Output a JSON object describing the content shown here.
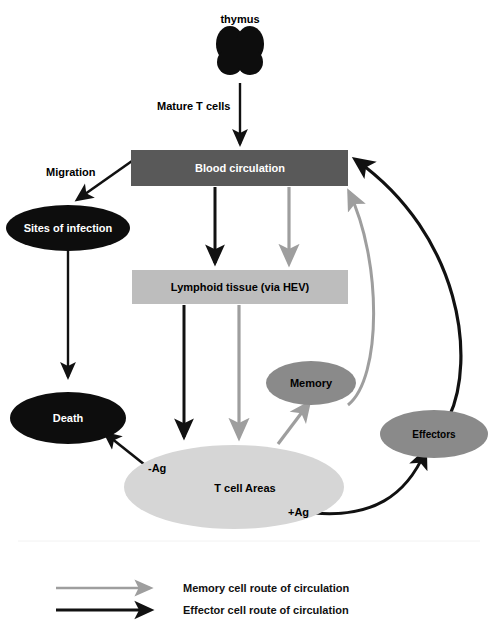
{
  "diagram": {
    "title_node": "thymus",
    "background": "#ffffff",
    "palette": {
      "black": "#0d0d0d",
      "dark_gray": "#595959",
      "mid_gray": "#8a8a8a",
      "light_gray": "#bdbdbd",
      "pale_gray": "#d6d6d6",
      "memory_arrow": "#9e9e9e",
      "effector_arrow": "#111111",
      "text_light": "#ffffff",
      "text_dark": "#000000"
    },
    "nodes": [
      {
        "id": "thymus",
        "label": "thymus",
        "shape": "bilobed",
        "fill": "#0d0d0d",
        "text_color": "#000000",
        "label_position": "above",
        "font_size": 11
      },
      {
        "id": "blood",
        "label": "Blood circulation",
        "shape": "rect",
        "fill": "#595959",
        "text_color": "#ffffff",
        "font_size": 11
      },
      {
        "id": "infection",
        "label": "Sites of infection",
        "shape": "ellipse",
        "fill": "#0d0d0d",
        "text_color": "#ffffff",
        "font_size": 11
      },
      {
        "id": "lymphoid",
        "label": "Lymphoid tissue (via HEV)",
        "shape": "rect",
        "fill": "#bdbdbd",
        "text_color": "#000000",
        "font_size": 11
      },
      {
        "id": "memory",
        "label": "Memory",
        "shape": "ellipse",
        "fill": "#8a8a8a",
        "text_color": "#000000",
        "font_size": 11
      },
      {
        "id": "death",
        "label": "Death",
        "shape": "ellipse",
        "fill": "#0d0d0d",
        "text_color": "#ffffff",
        "font_size": 11
      },
      {
        "id": "effectors",
        "label": "Effectors",
        "shape": "ellipse",
        "fill": "#8a8a8a",
        "text_color": "#000000",
        "font_size": 10
      },
      {
        "id": "tcellareas",
        "label": "T cell Areas",
        "shape": "ellipse",
        "fill": "#d6d6d6",
        "text_color": "#000000",
        "font_size": 11
      }
    ],
    "edge_labels": [
      {
        "id": "mature-t-cells",
        "text": "Mature T cells"
      },
      {
        "id": "migration",
        "text": "Migration"
      },
      {
        "id": "minus-ag",
        "text": "-Ag"
      },
      {
        "id": "plus-ag",
        "text": "+Ag"
      }
    ],
    "legend": {
      "items": [
        {
          "id": "memory-route",
          "label": "Memory cell route of circulation",
          "color": "#9e9e9e"
        },
        {
          "id": "effector-route",
          "label": "Effector cell route of circulation",
          "color": "#111111"
        }
      ]
    }
  }
}
